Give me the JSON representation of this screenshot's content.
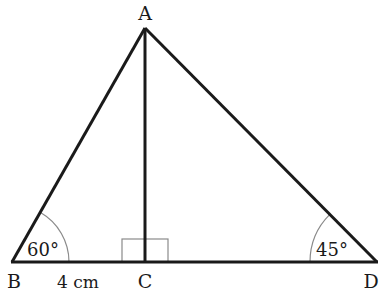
{
  "diagram": {
    "type": "triangle",
    "vertices": {
      "A": {
        "label": "A"
      },
      "B": {
        "label": "B"
      },
      "C": {
        "label": "C"
      },
      "D": {
        "label": "D"
      }
    },
    "angles": {
      "B": "60°",
      "D": "45°",
      "C": "right-angle"
    },
    "measurements": {
      "BC": "4 cm"
    },
    "colors": {
      "line": "#1a1a1a",
      "arc": "#8a8a8a",
      "right_angle_marker": "#8a8a8a"
    }
  }
}
